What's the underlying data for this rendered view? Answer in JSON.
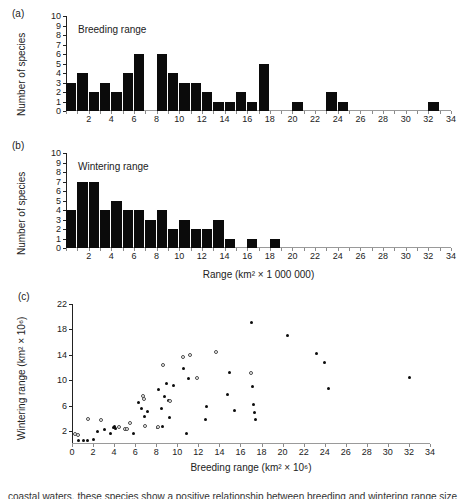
{
  "figure": {
    "panels": [
      {
        "letter": "(a)",
        "in_plot_title": "Breeding range"
      },
      {
        "letter": "(b)",
        "in_plot_title": "Wintering range"
      },
      {
        "letter": "(c)",
        "in_plot_title": ""
      }
    ],
    "axis_labels": {
      "panel_a_y": "Number of species",
      "panel_b_y": "Number of species",
      "panel_b_x": "Range (km² × 1 000 000)",
      "panel_c_y": "Wintering range (km² × 10⁶)",
      "panel_c_x": "Breeding range (km² × 10⁶)"
    },
    "hist_y_ticks": [
      "0",
      "1",
      "2",
      "3",
      "4",
      "5",
      "6",
      "7",
      "8",
      "9",
      "10"
    ],
    "hist_x_ticks": [
      "2",
      "4",
      "6",
      "8",
      "10",
      "12",
      "14",
      "16",
      "18",
      "20",
      "22",
      "24",
      "26",
      "28",
      "30",
      "32",
      "34"
    ],
    "scatter_y_ticks": [
      "2",
      "6",
      "10",
      "14",
      "18",
      "22"
    ],
    "scatter_x_ticks": [
      "0",
      "2",
      "4",
      "6",
      "8",
      "10",
      "12",
      "14",
      "16",
      "18",
      "20",
      "22",
      "24",
      "26",
      "28",
      "30",
      "32",
      "34"
    ],
    "colors": {
      "bar": "#0b0b0b",
      "axis": "#222222",
      "point_filled": "#0b0b0b",
      "point_open": "#4a4a4a"
    }
  },
  "chart_data": [
    {
      "type": "bar",
      "title": "Breeding range",
      "panel": "(a)",
      "xlabel": "",
      "ylabel": "Number of species",
      "xlim": [
        0,
        34
      ],
      "ylim": [
        0,
        10
      ],
      "bin_width": 1,
      "bin_starts": [
        0,
        1,
        2,
        3,
        4,
        5,
        6,
        8,
        9,
        10,
        11,
        12,
        13,
        14,
        15,
        16,
        17,
        20,
        23,
        24,
        32
      ],
      "values": [
        3,
        4,
        2,
        3,
        2,
        4,
        6,
        6,
        4,
        3,
        3,
        2,
        1,
        1,
        2,
        1,
        5,
        1,
        2,
        1,
        1
      ],
      "grid": false
    },
    {
      "type": "bar",
      "title": "Wintering range",
      "panel": "(b)",
      "xlabel": "Range (km² × 1 000 000)",
      "ylabel": "Number of species",
      "xlim": [
        0,
        34
      ],
      "ylim": [
        0,
        10
      ],
      "bin_width": 1,
      "bin_starts": [
        0,
        1,
        2,
        3,
        4,
        5,
        6,
        7,
        8,
        9,
        10,
        11,
        12,
        13,
        14,
        16,
        18
      ],
      "values": [
        4,
        7,
        7,
        4,
        5,
        4,
        4,
        3,
        4,
        2,
        3,
        2,
        2,
        3,
        1,
        1,
        1
      ],
      "grid": false
    },
    {
      "type": "scatter",
      "panel": "(c)",
      "title": "",
      "xlabel": "Breeding range (km² × 10⁶)",
      "ylabel": "Wintering range (km² × 10⁶)",
      "xlim": [
        0,
        34
      ],
      "ylim": [
        0,
        22
      ],
      "grid": false,
      "series": [
        {
          "name": "filled",
          "marker": "filled-circle",
          "points": [
            [
              0.6,
              0.6
            ],
            [
              1.1,
              0.6
            ],
            [
              1.5,
              0.6
            ],
            [
              2.0,
              0.7
            ],
            [
              2.4,
              2.0
            ],
            [
              3.1,
              2.3
            ],
            [
              3.7,
              1.7
            ],
            [
              3.9,
              2.6
            ],
            [
              4.0,
              2.7
            ],
            [
              4.1,
              2.5
            ],
            [
              5.1,
              2.3
            ],
            [
              5.8,
              1.6
            ],
            [
              6.3,
              6.5
            ],
            [
              6.6,
              5.6
            ],
            [
              6.9,
              4.3
            ],
            [
              7.2,
              5.1
            ],
            [
              8.1,
              2.6
            ],
            [
              8.2,
              8.6
            ],
            [
              8.5,
              5.6
            ],
            [
              8.6,
              2.7
            ],
            [
              8.8,
              7.5
            ],
            [
              9.0,
              9.5
            ],
            [
              9.2,
              6.8
            ],
            [
              9.3,
              4.2
            ],
            [
              9.6,
              9.2
            ],
            [
              10.6,
              11.9
            ],
            [
              10.9,
              1.7
            ],
            [
              11.1,
              10.3
            ],
            [
              12.7,
              3.9
            ],
            [
              12.8,
              5.9
            ],
            [
              14.8,
              7.8
            ],
            [
              15.0,
              11.2
            ],
            [
              15.4,
              5.3
            ],
            [
              17.0,
              19.1
            ],
            [
              17.1,
              9.0
            ],
            [
              17.2,
              6.2
            ],
            [
              17.3,
              5.0
            ],
            [
              17.4,
              3.9
            ],
            [
              20.5,
              17.0
            ],
            [
              23.2,
              14.2
            ],
            [
              24.0,
              12.8
            ],
            [
              24.4,
              8.8
            ],
            [
              32.1,
              10.4
            ]
          ]
        },
        {
          "name": "open",
          "marker": "open-circle",
          "points": [
            [
              0.3,
              1.5
            ],
            [
              0.6,
              1.4
            ],
            [
              1.5,
              4.0
            ],
            [
              2.8,
              3.7
            ],
            [
              4.5,
              2.6
            ],
            [
              5.0,
              2.3
            ],
            [
              5.2,
              2.3
            ],
            [
              5.5,
              3.3
            ],
            [
              6.7,
              7.6
            ],
            [
              6.8,
              7.1
            ],
            [
              6.9,
              2.8
            ],
            [
              8.2,
              2.7
            ],
            [
              8.6,
              12.4
            ],
            [
              9.3,
              6.7
            ],
            [
              10.5,
              13.6
            ],
            [
              11.2,
              14.0
            ],
            [
              11.9,
              10.3
            ],
            [
              13.7,
              14.4
            ],
            [
              17.0,
              11.2
            ]
          ]
        }
      ]
    }
  ],
  "caption_sliver": "coastal waters, these species show a positive relationship between breeding and wintering range size"
}
